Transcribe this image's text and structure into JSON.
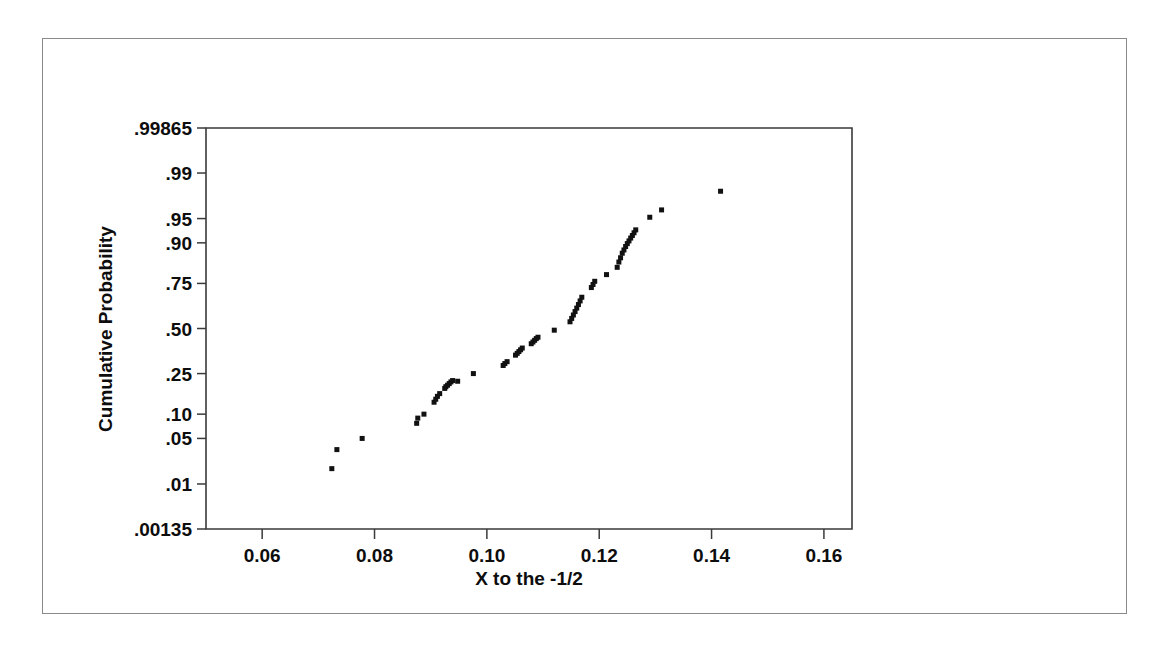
{
  "chart_data": {
    "type": "scatter",
    "title": "",
    "subtitle": "",
    "xlabel": "X to the -1/2",
    "ylabel": "Cumulative Probability",
    "xlim": [
      0.05,
      0.165
    ],
    "ylim_probability": [
      0.00135,
      0.99865
    ],
    "yscale": "normal-probability",
    "grid": false,
    "legend": null,
    "xticks": [
      0.06,
      0.08,
      0.1,
      0.12,
      0.14,
      0.16
    ],
    "xticklabels": [
      "0.06",
      "0.08",
      "0.10",
      "0.12",
      "0.14",
      "0.16"
    ],
    "yticks": [
      0.00135,
      0.01,
      0.05,
      0.1,
      0.25,
      0.5,
      0.75,
      0.9,
      0.95,
      0.99,
      0.99865
    ],
    "yticklabels": [
      ".00135",
      ".01",
      ".05",
      ".10",
      ".25",
      ".50",
      ".75",
      ".90",
      ".95",
      ".99",
      ".99865"
    ],
    "marker": "square",
    "marker_color": "#111111",
    "marker_size": 5,
    "n_points": 60,
    "series": [
      {
        "name": "X to the -1/2",
        "x": [
          0.0724,
          0.0733,
          0.0778,
          0.0875,
          0.0877,
          0.0888,
          0.0906,
          0.0909,
          0.0912,
          0.0916,
          0.0925,
          0.0927,
          0.093,
          0.0933,
          0.0936,
          0.0939,
          0.0948,
          0.0976,
          0.1029,
          0.1032,
          0.1036,
          0.1051,
          0.1054,
          0.1057,
          0.106,
          0.1063,
          0.1079,
          0.1082,
          0.1085,
          0.1088,
          0.1091,
          0.112,
          0.1148,
          0.1151,
          0.1154,
          0.1157,
          0.116,
          0.1163,
          0.1166,
          0.1169,
          0.1186,
          0.1189,
          0.1192,
          0.1213,
          0.1232,
          0.1235,
          0.1238,
          0.1241,
          0.1244,
          0.1247,
          0.125,
          0.1253,
          0.1256,
          0.1259,
          0.1262,
          0.1265,
          0.129,
          0.1311,
          0.1416
        ],
        "y": [
          0.018,
          0.035,
          0.05,
          0.078,
          0.09,
          0.1,
          0.135,
          0.145,
          0.155,
          0.165,
          0.185,
          0.192,
          0.198,
          0.205,
          0.212,
          0.218,
          0.215,
          0.25,
          0.29,
          0.3,
          0.31,
          0.345,
          0.355,
          0.365,
          0.375,
          0.385,
          0.41,
          0.42,
          0.43,
          0.44,
          0.448,
          0.49,
          0.54,
          0.56,
          0.58,
          0.6,
          0.62,
          0.64,
          0.66,
          0.68,
          0.73,
          0.745,
          0.76,
          0.79,
          0.82,
          0.84,
          0.855,
          0.87,
          0.88,
          0.89,
          0.898,
          0.905,
          0.912,
          0.918,
          0.924,
          0.93,
          0.952,
          0.962,
          0.98
        ]
      }
    ]
  },
  "axes": {
    "y_title": "Cumulative Probability",
    "x_title": "X to the -1/2"
  }
}
